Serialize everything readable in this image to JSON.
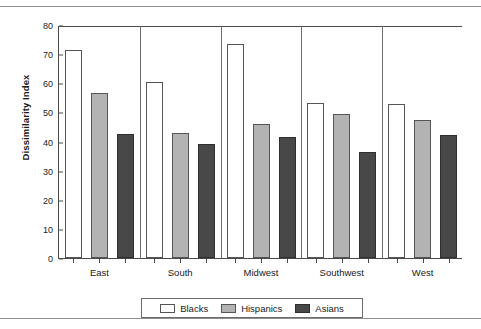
{
  "chart_data": {
    "type": "bar",
    "title": "",
    "subtitle": "",
    "xlabel": "",
    "ylabel": "Dissimilarity Index",
    "ylim": [
      0,
      80
    ],
    "yticks": [
      0,
      10,
      20,
      30,
      40,
      50,
      60,
      70,
      80
    ],
    "ytick_labels": [
      "0",
      "10",
      "20",
      "30",
      "40",
      "50",
      "60",
      "70",
      "80"
    ],
    "grid": false,
    "legend_position": "bottom",
    "categories": [
      "East",
      "South",
      "Midwest",
      "Southwest",
      "West"
    ],
    "series": [
      {
        "name": "Blacks",
        "color": "#ffffff",
        "edge_color": "#555555",
        "values": [
          71.5,
          60.3,
          73.5,
          53.2,
          52.8
        ]
      },
      {
        "name": "Hispanics",
        "color": "#b3b3b3",
        "edge_color": "#555555",
        "values": [
          56.8,
          43.0,
          46.0,
          49.5,
          47.5
        ]
      },
      {
        "name": "Asians",
        "color": "#484848",
        "edge_color": "#2e2e2e",
        "values": [
          42.5,
          39.0,
          41.5,
          36.5,
          42.3
        ]
      }
    ],
    "annotations": []
  },
  "legend": {
    "items": [
      {
        "label": "Blacks",
        "swatch": "blacks"
      },
      {
        "label": "Hispanics",
        "swatch": "hispanics"
      },
      {
        "label": "Asians",
        "swatch": "asians"
      }
    ]
  }
}
